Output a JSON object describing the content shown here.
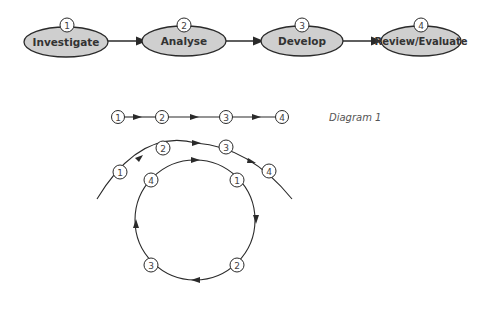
{
  "colors": {
    "stroke": "#2a2a2a",
    "oval_fill": "#cfcfcf",
    "circle_fill": "#ffffff",
    "background": "#ffffff"
  },
  "process_flow": {
    "stages": [
      {
        "number": "1",
        "label": "Investigate"
      },
      {
        "number": "2",
        "label": "Analyse"
      },
      {
        "number": "3",
        "label": "Develop"
      },
      {
        "number": "4",
        "label": "Review/Evaluate"
      }
    ]
  },
  "linear_diagram": {
    "caption": "Diagram 1",
    "nodes": [
      "1",
      "2",
      "3",
      "4"
    ]
  },
  "spiral_diagram": {
    "outer_arc_nodes": [
      "1",
      "2",
      "3",
      "4"
    ],
    "inner_cycle_nodes": [
      "1",
      "2",
      "3",
      "4"
    ]
  }
}
